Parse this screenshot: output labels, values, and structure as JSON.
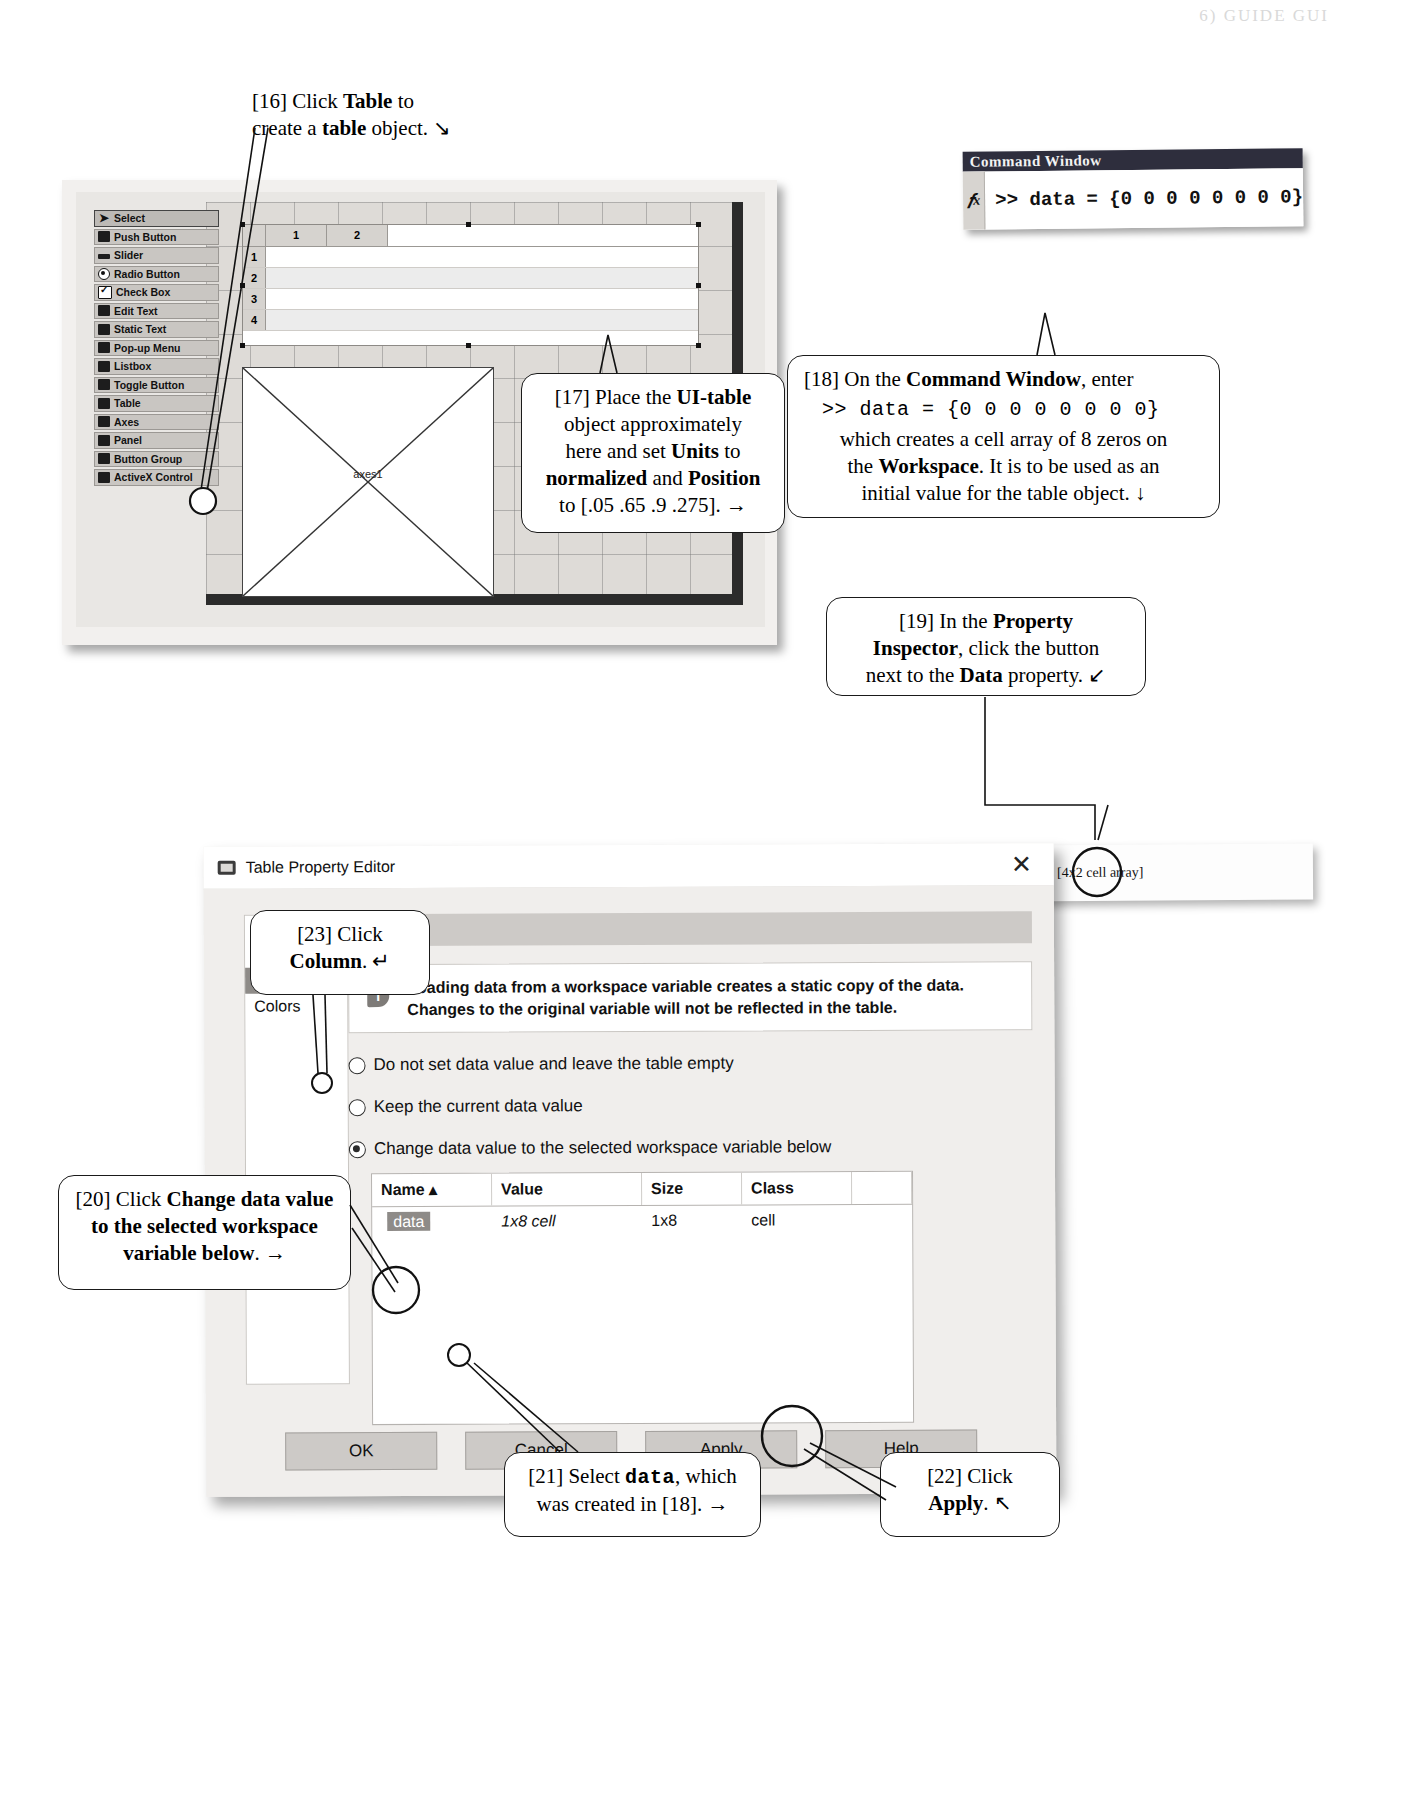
{
  "page": {
    "header_text": "6)  GUIDE GUI"
  },
  "guide_figure": {
    "palette_title": "Component Palette",
    "palette": [
      {
        "label": "Select",
        "icon": "arrow-cursor-icon",
        "selected": true
      },
      {
        "label": "Push Button",
        "icon": "push-button-icon",
        "selected": false
      },
      {
        "label": "Slider",
        "icon": "slider-icon",
        "selected": false
      },
      {
        "label": "Radio Button",
        "icon": "radio-button-icon",
        "selected": false
      },
      {
        "label": "Check Box",
        "icon": "check-box-icon",
        "selected": false
      },
      {
        "label": "Edit Text",
        "icon": "edit-text-icon",
        "selected": false
      },
      {
        "label": "Static Text",
        "icon": "static-text-icon",
        "selected": false
      },
      {
        "label": "Pop-up Menu",
        "icon": "popup-menu-icon",
        "selected": false
      },
      {
        "label": "Listbox",
        "icon": "listbox-icon",
        "selected": false
      },
      {
        "label": "Toggle Button",
        "icon": "toggle-button-icon",
        "selected": false
      },
      {
        "label": "Table",
        "icon": "table-icon",
        "selected": false
      },
      {
        "label": "Axes",
        "icon": "axes-icon",
        "selected": false
      },
      {
        "label": "Panel",
        "icon": "panel-icon",
        "selected": false
      },
      {
        "label": "Button Group",
        "icon": "button-group-icon",
        "selected": false
      },
      {
        "label": "ActiveX Control",
        "icon": "activex-icon",
        "selected": false
      }
    ],
    "table_preview": {
      "column_headers": [
        "1",
        "2"
      ],
      "row_headers": [
        "1",
        "2",
        "3",
        "4"
      ]
    },
    "axes_label": "axes1"
  },
  "command_window": {
    "title": "Command Window",
    "fx_icon": "fx-icon",
    "prompt_line": ">> data = {0 0 0 0 0 0 0 0}"
  },
  "property_inspector": {
    "property_name": "Data",
    "button_icon": "table-editor-button-icon",
    "value": "[4x2  cell array]"
  },
  "table_property_editor": {
    "title": "Table Property Editor",
    "title_icon": "table-editor-icon",
    "close_icon": "close-icon",
    "nav_items": [
      {
        "label": "Columns",
        "selected": false
      },
      {
        "label": "Rows",
        "selected": false
      },
      {
        "label": "Data",
        "selected": true
      },
      {
        "label": "Colors",
        "selected": false
      }
    ],
    "section_header": "Data",
    "info_icon": "info-icon",
    "note": "Loading data from a workspace variable creates a static copy of the data. Changes to the original variable will not be reflected in the table.",
    "radio_options": [
      {
        "label": "Do not set data value and leave the table empty",
        "selected": false
      },
      {
        "label": "Keep the current data value",
        "selected": false
      },
      {
        "label": "Change data value to the selected workspace variable below",
        "selected": true
      }
    ],
    "variable_table": {
      "columns": [
        "Name ▴",
        "Value",
        "Size",
        "Class",
        ""
      ],
      "rows": [
        {
          "name": "data",
          "value": "1x8 cell",
          "size": "1x8",
          "class": "cell",
          "extra": ""
        }
      ]
    },
    "buttons": [
      {
        "label": "OK"
      },
      {
        "label": "Cancel"
      },
      {
        "label": "Apply"
      },
      {
        "label": "Help"
      }
    ]
  },
  "callouts": {
    "c16": {
      "id": "[16]",
      "line1_pre": "[16] Click ",
      "line1_bold": "Table",
      "line1_post": " to",
      "line2_pre": "create a ",
      "line2_bold": "table",
      "line2_post": " object.  ↘"
    },
    "c17": {
      "id": "[17]",
      "l1_pre": "[17] Place the ",
      "l1_bold": "UI-table",
      "l2": "object approximately",
      "l3_pre": "here and set ",
      "l3_bold": "Units",
      "l3_post": " to",
      "l4_b1": "normalized",
      "l4_mid": " and ",
      "l4_b2": "Position",
      "l5": "to [.05 .65 .9 .275].  →"
    },
    "c18": {
      "id": "[18]",
      "l1_pre": "[18] On the ",
      "l1_bold": "Command Window",
      "l1_post": ", enter",
      "code": ">> data = {0 0 0 0 0 0 0 0}",
      "l3": "which creates a cell array of 8 zeros on",
      "l4_pre": "the ",
      "l4_bold": "Workspace",
      "l4_post": ".  It is to be used as an",
      "l5": "initial value for the table object.  ↓"
    },
    "c19": {
      "id": "[19]",
      "l1_pre": "[19] In the ",
      "l1_bold": "Property",
      "l2_bold": "Inspector",
      "l2_post": ", click the button",
      "l3_pre": "next to the ",
      "l3_bold": "Data",
      "l3_post": " property.  ↙"
    },
    "c20": {
      "id": "[20]",
      "l1_pre": "[20] Click ",
      "l1_bold": "Change data value",
      "l2_bold": "to the selected workspace",
      "l3_bold": "variable below",
      "l3_post": ".  →"
    },
    "c21": {
      "id": "[21]",
      "l1_pre": "[21] Select ",
      "l1_code": "data",
      "l1_post": ", which",
      "l2": "was created in [18].  →"
    },
    "c22": {
      "id": "[22]",
      "l1": "[22] Click",
      "l2_bold": "Apply",
      "l2_post": ".  ↖"
    },
    "c23": {
      "id": "[23]",
      "l1": "[23] Click",
      "l2_bold": "Column",
      "l2_post": ".  ↵"
    }
  }
}
